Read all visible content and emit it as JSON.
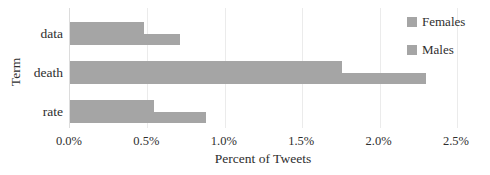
{
  "chart_data": {
    "type": "bar",
    "orientation": "horizontal",
    "title": "",
    "xlabel": "Percent of Tweets",
    "ylabel": "Term",
    "categories": [
      "data",
      "death",
      "rate"
    ],
    "series": [
      {
        "name": "Females",
        "values": [
          0.48,
          1.76,
          0.54
        ],
        "color": "#a5a5a5"
      },
      {
        "name": "Males",
        "values": [
          0.71,
          2.3,
          0.88
        ],
        "color": "#a5a5a5"
      }
    ],
    "xlim": [
      0,
      2.5
    ],
    "x_ticks": [
      "0.0%",
      "0.5%",
      "1.0%",
      "1.5%",
      "2.0%",
      "2.5%"
    ],
    "x_tick_values": [
      0,
      0.5,
      1.0,
      1.5,
      2.0,
      2.5
    ],
    "grid": "vertical-gridlines-on",
    "legend_position": "top-right"
  },
  "colors": {
    "bar": "#a5a5a5",
    "gridline": "#ebebeb",
    "axis_line": "#dcdcdc",
    "text": "#2e2e2e",
    "background": "#ffffff"
  }
}
